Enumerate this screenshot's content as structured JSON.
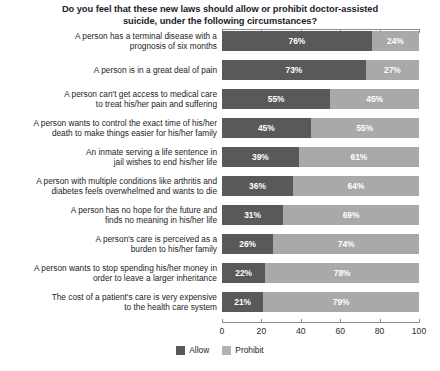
{
  "chart_data": {
    "type": "bar",
    "subtype": "100% stacked horizontal bar",
    "title": "Do you feel that these new laws should allow or prohibit doctor-assisted suicide, under the following circumstances?",
    "xlabel": "",
    "ylabel": "",
    "xlim": [
      0,
      100
    ],
    "xticks": [
      0,
      20,
      40,
      60,
      80,
      100
    ],
    "xtick_labels": [
      "0",
      "20",
      "40",
      "60",
      "80",
      "100"
    ],
    "grid": false,
    "legend_position": "bottom-center",
    "categories": [
      "A person has a terminal disease with a\nprognosis of six months",
      "A person is in a great deal of pain",
      "A person can't get access to medical care\nto treat his/her pain and suffering",
      "A person wants to control the exact time of his/her\ndeath to make things easier for his/her family",
      "An inmate serving a life sentence in\njail wishes to end his/her life",
      "A person with multiple conditions like arthritis and\ndiabetes feels overwhelmed and wants to die",
      "A person has no hope for the future and\nfinds no meaning in his/her life",
      "A person's care is perceived as a\nburden to his/her family",
      "A person wants to stop spending his/her money in\norder to leave a larger inheritance",
      "The cost of a patient's care is very expensive\nto the health care system"
    ],
    "series": [
      {
        "name": "Allow",
        "color": "#595959",
        "values": [
          76,
          73,
          55,
          45,
          39,
          36,
          31,
          26,
          22,
          21
        ],
        "labels": [
          "76%",
          "73%",
          "55%",
          "45%",
          "39%",
          "36%",
          "31%",
          "26%",
          "22%",
          "21%"
        ]
      },
      {
        "name": "Prohibit",
        "color": "#a9a9a9",
        "values": [
          24,
          27,
          45,
          55,
          61,
          64,
          69,
          74,
          78,
          79
        ],
        "labels": [
          "24%",
          "27%",
          "45%",
          "55%",
          "61%",
          "64%",
          "69%",
          "74%",
          "78%",
          "79%"
        ]
      }
    ]
  },
  "legend": {
    "items": [
      {
        "label": "Allow",
        "color": "#595959"
      },
      {
        "label": "Prohibit",
        "color": "#b3b3b3"
      }
    ]
  }
}
